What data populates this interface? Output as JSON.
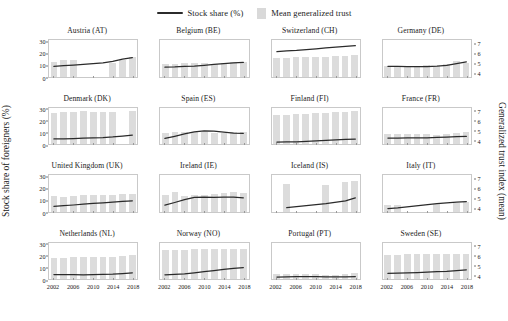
{
  "legend": {
    "line_label": "Stock share (%)",
    "bar_label": "Mean generalized trust",
    "line_color": "#2b2b2b",
    "bar_color": "#dcdcdc"
  },
  "axes": {
    "ylabel_left": "Stock share of foreigners (%)",
    "ylabel_right": "Generalized trust index (mean)",
    "left_ticks": [
      "0",
      "10",
      "20",
      "30"
    ],
    "right_ticks": [
      "4",
      "5",
      "6",
      "7"
    ],
    "x_ticks": [
      "2002",
      "2006",
      "2010",
      "2014",
      "2018"
    ],
    "left_lim": [
      0,
      32
    ],
    "right_lim": [
      3.6,
      7.4
    ],
    "x_lim": [
      2001,
      2019
    ]
  },
  "chart_data": {
    "type": "bar",
    "title": "",
    "xlabel": "",
    "ylabel": "Stock share of foreigners (%)",
    "ylabel_secondary": "Generalized trust index (mean)",
    "ylim": [
      0,
      32
    ],
    "ylim_secondary": [
      3.6,
      7.4
    ],
    "grid": false,
    "legend_position": "top-center",
    "x": [
      2002,
      2004,
      2006,
      2008,
      2010,
      2012,
      2014,
      2016,
      2018
    ],
    "series_names": [
      "Stock share (%)",
      "Mean generalized trust"
    ],
    "panels": [
      {
        "code": "AT",
        "title": "Austria (AT)",
        "bars_years": [
          2002,
          2004,
          2006,
          2008,
          2010,
          2012,
          2014,
          2016,
          2018
        ],
        "bars": [
          5.1,
          5.3,
          5.3,
          null,
          null,
          null,
          5.0,
          5.3,
          5.6
        ],
        "line_years": [
          2002,
          2004,
          2006,
          2008,
          2010,
          2012,
          2014,
          2016,
          2018
        ],
        "line": [
          8.8,
          9.5,
          10.0,
          10.6,
          11.2,
          11.9,
          13.2,
          15.2,
          16.5
        ]
      },
      {
        "code": "BE",
        "title": "Belgium (BE)",
        "bars_years": [
          2002,
          2004,
          2006,
          2008,
          2010,
          2012,
          2014,
          2016,
          2018
        ],
        "bars": [
          4.9,
          4.9,
          5.0,
          5.0,
          5.0,
          4.9,
          5.0,
          5.1,
          5.1
        ],
        "line_years": [
          2002,
          2004,
          2006,
          2008,
          2010,
          2012,
          2014,
          2016,
          2018
        ],
        "line": [
          8.2,
          8.4,
          8.8,
          9.1,
          9.8,
          10.6,
          11.3,
          11.9,
          12.3
        ]
      },
      {
        "code": "CH",
        "title": "Switzerland (CH)",
        "bars_years": [
          2002,
          2004,
          2006,
          2008,
          2010,
          2012,
          2014,
          2016,
          2018
        ],
        "bars": [
          5.5,
          5.5,
          5.6,
          5.6,
          5.6,
          5.6,
          5.7,
          5.7,
          5.8
        ],
        "line_years": [
          2002,
          2004,
          2006,
          2008,
          2010,
          2012,
          2014,
          2016,
          2018
        ],
        "line": [
          21.8,
          22.4,
          22.9,
          23.6,
          24.3,
          25.1,
          25.8,
          26.4,
          27.0
        ]
      },
      {
        "code": "DE",
        "title": "Germany (DE)",
        "bars_years": [
          2002,
          2004,
          2006,
          2008,
          2010,
          2012,
          2014,
          2016,
          2018
        ],
        "bars": [
          4.7,
          4.6,
          4.7,
          4.7,
          4.8,
          4.7,
          4.9,
          5.2,
          5.0
        ],
        "line_years": [
          2002,
          2004,
          2006,
          2008,
          2010,
          2012,
          2014,
          2016,
          2018
        ],
        "line": [
          8.9,
          8.8,
          8.7,
          8.6,
          8.7,
          9.1,
          9.8,
          11.3,
          12.8
        ]
      },
      {
        "code": "DK",
        "title": "Denmark (DK)",
        "bars_years": [
          2002,
          2004,
          2006,
          2008,
          2010,
          2012,
          2014,
          2016,
          2018
        ],
        "bars": [
          6.8,
          6.9,
          6.9,
          7.0,
          6.9,
          6.9,
          6.9,
          null,
          7.0
        ],
        "line_years": [
          2002,
          2004,
          2006,
          2008,
          2010,
          2012,
          2014,
          2016,
          2018
        ],
        "line": [
          4.9,
          5.0,
          5.2,
          5.5,
          5.8,
          6.1,
          6.6,
          7.4,
          8.3
        ]
      },
      {
        "code": "ES",
        "title": "Spain (ES)",
        "bars_years": [
          2002,
          2004,
          2006,
          2008,
          2010,
          2012,
          2014,
          2016,
          2018
        ],
        "bars": [
          4.7,
          4.8,
          4.8,
          4.9,
          4.8,
          4.7,
          4.7,
          4.8,
          4.9
        ],
        "line_years": [
          2002,
          2004,
          2006,
          2008,
          2010,
          2012,
          2014,
          2016,
          2018
        ],
        "line": [
          5.3,
          7.2,
          9.3,
          11.1,
          11.9,
          11.7,
          10.8,
          10.0,
          9.8
        ]
      },
      {
        "code": "FI",
        "title": "Finland (FI)",
        "bars_years": [
          2002,
          2004,
          2006,
          2008,
          2010,
          2012,
          2014,
          2016,
          2018
        ],
        "bars": [
          6.6,
          6.6,
          6.7,
          6.7,
          6.8,
          6.8,
          6.9,
          6.9,
          7.0
        ],
        "line_years": [
          2002,
          2004,
          2006,
          2008,
          2010,
          2012,
          2014,
          2016,
          2018
        ],
        "line": [
          2.0,
          2.2,
          2.4,
          2.7,
          3.1,
          3.6,
          4.0,
          4.4,
          4.8
        ]
      },
      {
        "code": "FR",
        "title": "France (FR)",
        "bars_years": [
          2002,
          2004,
          2006,
          2008,
          2010,
          2012,
          2014,
          2016,
          2018
        ],
        "bars": [
          4.6,
          4.6,
          4.6,
          4.6,
          4.6,
          4.5,
          4.6,
          4.7,
          4.8
        ],
        "line_years": [
          2002,
          2004,
          2006,
          2008,
          2010,
          2012,
          2014,
          2016,
          2018
        ],
        "line": [
          5.6,
          5.6,
          5.7,
          5.8,
          5.9,
          6.2,
          6.5,
          6.8,
          7.1
        ]
      },
      {
        "code": "UK",
        "title": "United Kingdom (UK)",
        "bars_years": [
          2002,
          2004,
          2006,
          2008,
          2010,
          2012,
          2014,
          2016,
          2018
        ],
        "bars": [
          5.2,
          5.1,
          5.2,
          5.3,
          5.3,
          5.3,
          5.3,
          5.4,
          5.4
        ],
        "line_years": [
          2002,
          2004,
          2006,
          2008,
          2010,
          2012,
          2014,
          2016,
          2018
        ],
        "line": [
          4.6,
          5.1,
          5.7,
          6.4,
          7.1,
          7.6,
          8.2,
          8.8,
          9.3
        ]
      },
      {
        "code": "IE",
        "title": "Ireland (IE)",
        "bars_years": [
          2002,
          2004,
          2006,
          2008,
          2010,
          2012,
          2014,
          2016,
          2018
        ],
        "bars": [
          5.3,
          5.6,
          5.2,
          5.3,
          5.3,
          5.4,
          5.5,
          5.6,
          5.5
        ],
        "line_years": [
          2002,
          2004,
          2006,
          2008,
          2010,
          2012,
          2014,
          2016,
          2018
        ],
        "line": [
          5.5,
          7.9,
          10.4,
          12.3,
          12.6,
          12.4,
          12.5,
          12.5,
          12.0
        ]
      },
      {
        "code": "IS",
        "title": "Iceland (IS)",
        "bars_years": [
          2004,
          2012,
          2016,
          2018
        ],
        "bars": [
          6.5,
          6.4,
          6.7,
          6.8
        ],
        "line_years": [
          2004,
          2012,
          2016,
          2018
        ],
        "line": [
          3.3,
          6.9,
          9.4,
          12.0
        ]
      },
      {
        "code": "IT",
        "title": "Italy (IT)",
        "bars_years": [
          2002,
          2004,
          2012,
          2016,
          2018
        ],
        "bars": [
          4.3,
          4.3,
          4.4,
          4.5,
          4.6
        ],
        "line_years": [
          2002,
          2004,
          2012,
          2016,
          2018
        ],
        "line": [
          2.6,
          3.1,
          6.8,
          8.3,
          8.7
        ]
      },
      {
        "code": "NL",
        "title": "Netherlands (NL)",
        "bars_years": [
          2002,
          2004,
          2006,
          2008,
          2010,
          2012,
          2014,
          2016,
          2018
        ],
        "bars": [
          5.8,
          5.8,
          5.9,
          5.9,
          5.9,
          5.9,
          5.9,
          6.0,
          6.1
        ],
        "line_years": [
          2002,
          2004,
          2006,
          2008,
          2010,
          2012,
          2014,
          2016,
          2018
        ],
        "line": [
          4.3,
          4.3,
          4.2,
          4.1,
          4.2,
          4.4,
          4.7,
          5.2,
          5.8
        ]
      },
      {
        "code": "NO",
        "title": "Norway (NO)",
        "bars_years": [
          2002,
          2004,
          2006,
          2008,
          2010,
          2012,
          2014,
          2016,
          2018
        ],
        "bars": [
          6.6,
          6.6,
          6.6,
          6.7,
          6.7,
          6.7,
          6.7,
          6.7,
          6.7
        ],
        "line_years": [
          2002,
          2004,
          2006,
          2008,
          2010,
          2012,
          2014,
          2016,
          2018
        ],
        "line": [
          4.1,
          4.5,
          5.0,
          5.9,
          6.8,
          7.8,
          8.8,
          9.8,
          10.5
        ]
      },
      {
        "code": "PT",
        "title": "Portugal (PT)",
        "bars_years": [
          2002,
          2004,
          2006,
          2008,
          2010,
          2012,
          2014,
          2016,
          2018
        ],
        "bars": [
          4.1,
          4.1,
          4.1,
          4.1,
          4.1,
          4.0,
          4.0,
          4.1,
          4.2
        ],
        "line_years": [
          2002,
          2004,
          2006,
          2008,
          2010,
          2012,
          2014,
          2016,
          2018
        ],
        "line": [
          2.1,
          2.3,
          2.5,
          2.6,
          2.6,
          2.4,
          2.2,
          2.3,
          2.6
        ]
      },
      {
        "code": "SE",
        "title": "Sweden (SE)",
        "bars_years": [
          2002,
          2004,
          2006,
          2008,
          2010,
          2012,
          2014,
          2016,
          2018
        ],
        "bars": [
          6.1,
          6.1,
          6.2,
          6.2,
          6.2,
          6.2,
          6.2,
          6.2,
          6.2
        ],
        "line_years": [
          2002,
          2004,
          2006,
          2008,
          2010,
          2012,
          2014,
          2016,
          2018
        ],
        "line": [
          5.3,
          5.5,
          5.7,
          6.0,
          6.4,
          6.8,
          7.1,
          7.8,
          8.5
        ]
      }
    ]
  }
}
